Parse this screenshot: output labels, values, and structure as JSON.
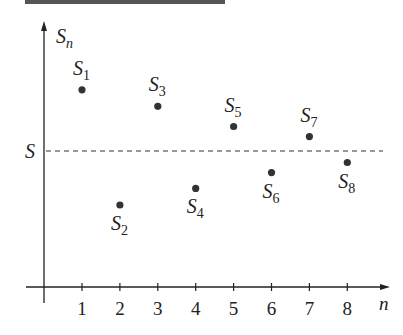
{
  "chart_data": {
    "type": "scatter",
    "title": "",
    "xlabel": "n",
    "ylabel": "S_n",
    "x": [
      1,
      2,
      3,
      4,
      5,
      6,
      7,
      8
    ],
    "values": [
      0.85,
      -0.75,
      0.62,
      -0.52,
      0.34,
      -0.3,
      0.2,
      -0.16
    ],
    "point_labels": [
      "S1",
      "S2",
      "S3",
      "S4",
      "S5",
      "S6",
      "S7",
      "S8"
    ],
    "x_ticks": [
      "1",
      "2",
      "3",
      "4",
      "5",
      "6",
      "7",
      "8"
    ],
    "limit_line": {
      "label": "S",
      "value": 0,
      "style": "dashed"
    },
    "grid": false,
    "legend": null,
    "colors": {
      "points": "#333333",
      "axis": "#222222",
      "top_bar": "#555555"
    }
  },
  "axes": {
    "y_label_main": "S",
    "y_label_sub": "n",
    "x_label": "n",
    "limit_label": "S"
  }
}
